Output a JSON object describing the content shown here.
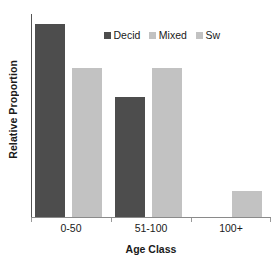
{
  "chart_data": {
    "type": "bar",
    "title": "",
    "subtitle": "",
    "xlabel": "Age Class",
    "ylabel": "Relative Proportion",
    "categories": [
      "0-50",
      "51-100",
      "100+"
    ],
    "series": [
      {
        "name": "Decid",
        "color": "#4d4d4d",
        "values": [
          1.0,
          0.62,
          0.0
        ]
      },
      {
        "name": "Mixed",
        "color": "#c2c2c2",
        "values": [
          0.77,
          0.77,
          0.135
        ]
      },
      {
        "name": "Sw",
        "color": "#c2c2c2",
        "values": [
          0.0,
          0.0,
          0.0
        ]
      }
    ],
    "ylim": [
      0,
      1.05
    ],
    "y_tick_labels": [],
    "grid": false,
    "legend_position": "top-center",
    "axis_color": "#8a8a8a",
    "background": "#ffffff"
  },
  "legend": {
    "items": [
      {
        "label": "Decid",
        "color": "#4d4d4d"
      },
      {
        "label": "Mixed",
        "color": "#c2c2c2"
      },
      {
        "label": "Sw",
        "color": "#c2c2c2"
      }
    ]
  },
  "axes": {
    "x_title": "Age Class",
    "y_title": "Relative Proportion",
    "x_tick_labels": [
      "0-50",
      "51-100",
      "100+"
    ]
  }
}
